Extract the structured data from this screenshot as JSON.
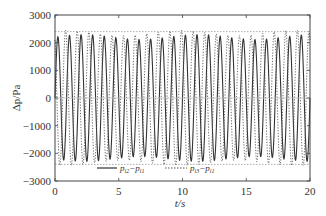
{
  "chart_data": {
    "type": "line",
    "title": "",
    "xlabel": "t/s",
    "ylabel": "Δp/Pa",
    "xlim": [
      0,
      20
    ],
    "ylim": [
      -3000,
      3000
    ],
    "x_ticks": [
      0,
      5,
      10,
      15,
      20
    ],
    "y_ticks": [
      -3000,
      -2000,
      -1000,
      0,
      1000,
      2000,
      3000
    ],
    "grid": false,
    "zero_line": true,
    "reference_lines": [
      {
        "y": 2400,
        "style": "dotted"
      },
      {
        "y": -2400,
        "style": "dotted"
      }
    ],
    "legend_position": "inside-bottom",
    "series": [
      {
        "name": "p_i2 − p_i1",
        "style": "solid",
        "color": "#333333",
        "description": "sinusoidal oscillation, ~1.1 Hz, amplitude ~2100-2300 Pa",
        "frequency_hz": 1.1,
        "amplitude": 2200,
        "phase": 0
      },
      {
        "name": "p_i3 − p_i1",
        "style": "dotted",
        "color": "#555555",
        "description": "sinusoidal oscillation, ~1.1 Hz, amplitude ~2300-2400 Pa, phase-shifted",
        "frequency_hz": 1.1,
        "amplitude": 2350,
        "phase": 2.1
      }
    ]
  },
  "legend": {
    "series1_label": "p",
    "series1_sub_a": "i2",
    "series1_mid": "−p",
    "series1_sub_b": "i1",
    "series2_label": "p",
    "series2_sub_a": "i3",
    "series2_mid": "−p",
    "series2_sub_b": "i1"
  },
  "axes": {
    "x_title": "t/s",
    "y_title": "Δp/Pa"
  }
}
